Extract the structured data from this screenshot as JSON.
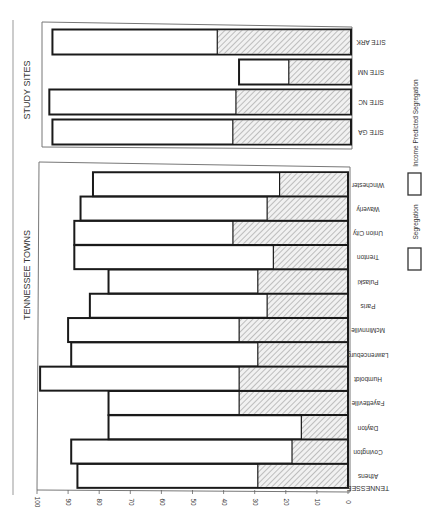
{
  "chart_data": {
    "type": "bar",
    "orientation": "figure rotated 90° clockwise; bars extend from 0 (right) to 100 (left)",
    "title": "",
    "xlabel": "",
    "ylabel": "",
    "ylim": [
      0,
      100
    ],
    "ticks": [
      "0",
      "10",
      "20",
      "30",
      "40",
      "50",
      "60",
      "70",
      "80",
      "90",
      "100"
    ],
    "grid": false,
    "legend_position": "right (rotated)",
    "legend": [
      {
        "name": "Segregation",
        "style": "hatched"
      },
      {
        "name": "Income Predicted Segregation",
        "style": "outline"
      }
    ],
    "groups": [
      {
        "label": "TENNESSEE TOWNS",
        "axis_label": "TENNESSEE",
        "categories": [
          "Athens",
          "Covington",
          "Dayton",
          "Fayetteville",
          "Humboldt",
          "Lawrenceburg",
          "McMinnville",
          "Paris",
          "Pulaski",
          "Trenton",
          "Union City",
          "Waverly",
          "Winchester"
        ],
        "series": [
          {
            "name": "Segregation",
            "values": [
              29,
              18,
              15,
              35,
              35,
              29,
              35,
              26,
              29,
              24,
              37,
              26,
              22
            ]
          },
          {
            "name": "Income Predicted Segregation",
            "values": [
              87,
              89,
              77,
              77,
              99,
              89,
              90,
              83,
              77,
              88,
              88,
              86,
              82
            ]
          }
        ]
      },
      {
        "label": "STUDY SITES",
        "categories": [
          "SITE GA",
          "SITE NC",
          "SITE NM",
          "SITE ARK"
        ],
        "series": [
          {
            "name": "Segregation",
            "values": [
              38,
              37,
              20,
              43
            ]
          },
          {
            "name": "Income Predicted Segregation",
            "values": [
              96,
              97,
              36,
              96
            ]
          }
        ]
      }
    ]
  },
  "labels": {
    "tennessee_header": "TENNESSEE TOWNS",
    "study_header": "STUDY SITES",
    "tennessee_axis": "TENNESSEE"
  },
  "colors": {
    "hatch": "#8a8a8a",
    "hatch_bg": "#f1f1f1",
    "outline": "#1a1a1a",
    "panel": "#777777"
  }
}
